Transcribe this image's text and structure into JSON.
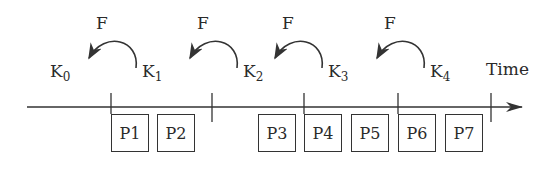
{
  "diagram": {
    "axis_label": "Time",
    "function_label": "F",
    "keys": [
      {
        "base": "K",
        "sub": "0"
      },
      {
        "base": "K",
        "sub": "1"
      },
      {
        "base": "K",
        "sub": "2"
      },
      {
        "base": "K",
        "sub": "3"
      },
      {
        "base": "K",
        "sub": "4"
      }
    ],
    "arrows": [
      {
        "label": "F",
        "from": "K1",
        "to": "K0"
      },
      {
        "label": "F",
        "from": "K2",
        "to": "K1"
      },
      {
        "label": "F",
        "from": "K3",
        "to": "K2"
      },
      {
        "label": "F",
        "from": "K4",
        "to": "K3"
      }
    ],
    "packets": [
      "P1",
      "P2",
      "P3",
      "P4",
      "P5",
      "P6",
      "P7"
    ],
    "colors": {
      "ink": "#2a2a2a",
      "background": "#ffffff"
    }
  }
}
